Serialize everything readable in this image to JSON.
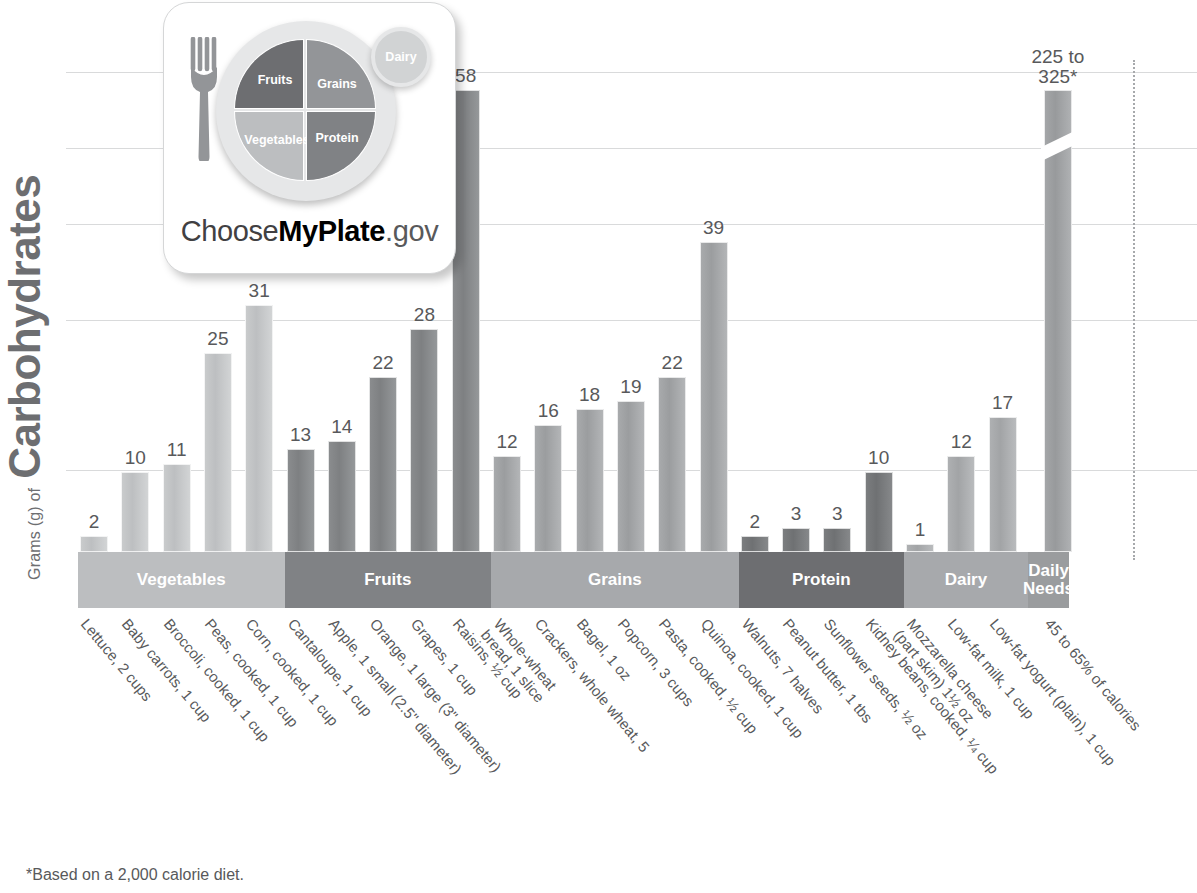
{
  "axis": {
    "y_prefix": "Grams (g) of",
    "y_title": "Carbohydrates"
  },
  "footnote": "*Based on a 2,000 calorie diet.",
  "daily_needs_annotation": {
    "line1": "225 to",
    "line2": "325*"
  },
  "logo": {
    "name": "ChooseMyPlate.gov",
    "text_choose": "Choose",
    "text_myplate": "MyPlate",
    "text_gov": ".gov",
    "quadrants": {
      "fruits": "Fruits",
      "grains": "Grains",
      "vegetables": "Vegetables",
      "protein": "Protein",
      "dairy": "Dairy"
    }
  },
  "groups": [
    {
      "label": "Vegetables",
      "color": "#bcbec0",
      "count": 5
    },
    {
      "label": "Fruits",
      "color": "#808285",
      "count": 5
    },
    {
      "label": "Grains",
      "color": "#a7a9ac",
      "count": 6
    },
    {
      "label": "Protein",
      "color": "#6d6e71",
      "count": 4
    },
    {
      "label": "Dairy",
      "color": "#a7a9ac",
      "count": 3
    },
    {
      "label": "Daily Needs",
      "color": "#9a9c9e",
      "count": 1
    }
  ],
  "chart_data": {
    "type": "bar",
    "title": "Grams (g) of Carbohydrates",
    "xlabel": "",
    "ylabel": "Grams (g) of Carbohydrates",
    "ylim": [
      0,
      65
    ],
    "grid": true,
    "legend": "none",
    "note": "Final bar 'Daily Needs' uses a broken axis; its value is a range 225 to 325 grams.",
    "categories": [
      "Lettuce, 2 cups",
      "Baby carrots, 1 cup",
      "Broccoli, cooked, 1 cup",
      "Peas, cooked, 1 cup",
      "Corn, cooked, 1 cup",
      "Cantaloupe, 1 cup",
      "Apple, 1 small (2.5\" diameter)",
      "Orange, 1 large (3\" diameter)",
      "Grapes, 1 cup",
      "Raisins, ½ cup",
      "Whole-wheat bread, 1 slice",
      "Crackers, whole wheat, 5",
      "Bagel, 1 oz",
      "Popcorn, 3 cups",
      "Pasta, cooked, ½ cup",
      "Quinoa, cooked, 1 cup",
      "Walnuts, 7 halves",
      "Peanut butter, 1 tbs",
      "Sunflower seeds, ½ oz",
      "Kidney beans, cooked, ¼ cup",
      "Mozzarella cheese (part skim) 1½ oz",
      "Low-fat milk, 1 cup",
      "Low-fat yogurt (plain), 1 cup",
      "45 to 65% of calories"
    ],
    "values": [
      2,
      10,
      11,
      25,
      31,
      13,
      14,
      22,
      28,
      58,
      12,
      16,
      18,
      19,
      22,
      39,
      2,
      3,
      3,
      10,
      1,
      12,
      17,
      275
    ],
    "value_labels": [
      "2",
      "10",
      "11",
      "25",
      "31",
      "13",
      "14",
      "22",
      "28",
      "58",
      "12",
      "16",
      "18",
      "19",
      "22",
      "39",
      "2",
      "3",
      "3",
      "10",
      "1",
      "12",
      "17",
      "225 to 325*"
    ]
  },
  "bars": [
    {
      "label": "Lettuce, 2 cups",
      "value": 2,
      "display": "2",
      "group": "Vegetables"
    },
    {
      "label": "Baby carrots, 1 cup",
      "value": 10,
      "display": "10",
      "group": "Vegetables"
    },
    {
      "label": "Broccoli, cooked, 1 cup",
      "value": 11,
      "display": "11",
      "group": "Vegetables"
    },
    {
      "label": "Peas, cooked, 1 cup",
      "value": 25,
      "display": "25",
      "group": "Vegetables"
    },
    {
      "label": "Corn, cooked, 1 cup",
      "value": 31,
      "display": "31",
      "group": "Vegetables"
    },
    {
      "label": "Cantaloupe, 1 cup",
      "value": 13,
      "display": "13",
      "group": "Fruits"
    },
    {
      "label": "Apple, 1 small (2.5\" diameter)",
      "value": 14,
      "display": "14",
      "group": "Fruits"
    },
    {
      "label": "Orange, 1 large (3\" diameter)",
      "value": 22,
      "display": "22",
      "group": "Fruits"
    },
    {
      "label": "Grapes, 1 cup",
      "value": 28,
      "display": "28",
      "group": "Fruits"
    },
    {
      "label": "Raisins, ½ cup",
      "value": 58,
      "display": "58",
      "group": "Fruits"
    },
    {
      "label": "Whole-wheat bread, 1 slice",
      "value": 12,
      "display": "12",
      "group": "Grains"
    },
    {
      "label": "Crackers, whole wheat, 5",
      "value": 16,
      "display": "16",
      "group": "Grains"
    },
    {
      "label": "Bagel, 1 oz",
      "value": 18,
      "display": "18",
      "group": "Grains"
    },
    {
      "label": "Popcorn, 3 cups",
      "value": 19,
      "display": "19",
      "group": "Grains"
    },
    {
      "label": "Pasta, cooked, ½ cup",
      "value": 22,
      "display": "22",
      "group": "Grains"
    },
    {
      "label": "Quinoa, cooked, 1 cup",
      "value": 39,
      "display": "39",
      "group": "Grains"
    },
    {
      "label": "Walnuts, 7 halves",
      "value": 2,
      "display": "2",
      "group": "Protein"
    },
    {
      "label": "Peanut butter, 1 tbs",
      "value": 3,
      "display": "3",
      "group": "Protein"
    },
    {
      "label": "Sunflower seeds, ½ oz",
      "value": 3,
      "display": "3",
      "group": "Protein"
    },
    {
      "label": "Kidney beans, cooked, ¼ cup",
      "value": 10,
      "display": "10",
      "group": "Protein"
    },
    {
      "label": "Mozzarella cheese (part skim) 1½ oz",
      "value": 1,
      "display": "1",
      "group": "Dairy"
    },
    {
      "label": "Low-fat milk, 1 cup",
      "value": 12,
      "display": "12",
      "group": "Dairy"
    },
    {
      "label": "Low-fat yogurt (plain), 1 cup",
      "value": 17,
      "display": "17",
      "group": "Dairy"
    },
    {
      "label": "45 to 65% of calories",
      "value": 275,
      "display": "225 to 325*",
      "group": "Daily Needs"
    }
  ],
  "xlabels_multiline": {
    "6": [
      "Apple, 1 small (2.5\" diameter)"
    ],
    "10": [
      "Whole-wheat",
      "bread, 1 slice"
    ],
    "20": [
      "Mozzarella cheese",
      "(part skim) 1½ oz"
    ]
  }
}
